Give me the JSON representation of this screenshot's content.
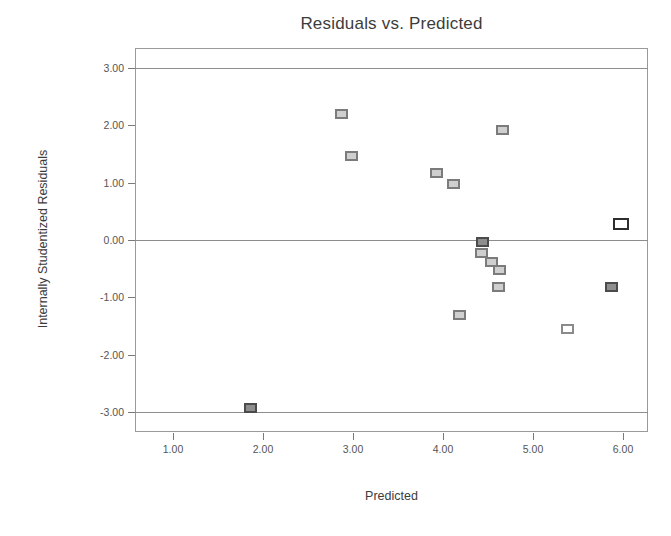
{
  "chart_data": {
    "type": "scatter",
    "title": "Residuals vs. Predicted",
    "xlabel": "Predicted",
    "ylabel": "Internally Studentized Residuals",
    "xlim": [
      0.58,
      6.28
    ],
    "ylim": [
      -3.35,
      3.35
    ],
    "grid": false,
    "reference_lines": [
      {
        "axis": "y",
        "value": 3.0,
        "style": "solid-gray"
      },
      {
        "axis": "y",
        "value": 0.0,
        "style": "solid-gray"
      },
      {
        "axis": "y",
        "value": -3.0,
        "style": "solid-gray"
      }
    ],
    "legend": null,
    "xticks": [
      "1.00",
      "2.00",
      "3.00",
      "4.00",
      "5.00",
      "6.00"
    ],
    "xtick_values": [
      1.0,
      2.0,
      3.0,
      4.0,
      5.0,
      6.0
    ],
    "yticks": [
      "3.00",
      "2.00",
      "1.00",
      "0.00",
      "-1.00",
      "-2.00",
      "-3.00"
    ],
    "ytick_values": [
      3.0,
      2.0,
      1.0,
      0.0,
      -1.0,
      -2.0,
      -3.0
    ],
    "points": [
      {
        "x": 1.86,
        "y": -2.93,
        "style": "dark"
      },
      {
        "x": 2.87,
        "y": 2.2,
        "style": "normal"
      },
      {
        "x": 2.98,
        "y": 1.47,
        "style": "normal"
      },
      {
        "x": 3.93,
        "y": 1.17,
        "style": "normal"
      },
      {
        "x": 4.12,
        "y": 0.98,
        "style": "normal"
      },
      {
        "x": 4.19,
        "y": -1.3,
        "style": "normal"
      },
      {
        "x": 4.44,
        "y": -0.04,
        "style": "dark"
      },
      {
        "x": 4.43,
        "y": -0.22,
        "style": "normal"
      },
      {
        "x": 4.54,
        "y": -0.38,
        "style": "normal"
      },
      {
        "x": 4.63,
        "y": -0.53,
        "style": "normal"
      },
      {
        "x": 4.62,
        "y": -0.82,
        "style": "normal"
      },
      {
        "x": 4.66,
        "y": 1.92,
        "style": "normal"
      },
      {
        "x": 5.39,
        "y": -1.55,
        "style": "hollow"
      },
      {
        "x": 5.87,
        "y": -0.82,
        "style": "dark"
      },
      {
        "x": 5.98,
        "y": 0.28,
        "style": "outlier"
      }
    ]
  }
}
